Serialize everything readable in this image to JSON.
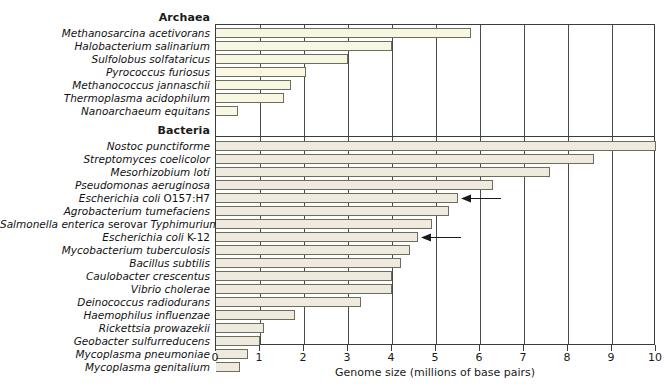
{
  "chart_data": {
    "type": "bar",
    "orientation": "horizontal",
    "title": "",
    "xlabel": "Genome size (millions of base pairs)",
    "ylabel": "",
    "xlim": [
      0,
      10
    ],
    "xticks": [
      "0",
      "1",
      "2",
      "3",
      "4",
      "5",
      "6",
      "7",
      "8",
      "9",
      "10"
    ],
    "grid": true,
    "grid_axis": "x",
    "legend": false,
    "groups": [
      {
        "name": "Archaea",
        "bar_color": "#f7f7e2",
        "categories": [
          "Methanosarcina acetivorans",
          "Halobacterium salinarium",
          "Sulfolobus solfataricus",
          "Pyrococcus furiosus",
          "Methanococcus jannaschii",
          "Thermoplasma acidophilum",
          "Nanoarchaeum equitans"
        ],
        "values": [
          5.8,
          4.0,
          3.0,
          2.05,
          1.7,
          1.55,
          0.5
        ]
      },
      {
        "name": "Bacteria",
        "bar_color": "#efeade",
        "categories": [
          "Nostoc punctiforme",
          "Streptomyces coelicolor",
          "Mesorhizobium loti",
          "Pseudomonas aeruginosa",
          "Escherichia coli O157:H7",
          "Agrobacterium tumefaciens",
          "Salmonella enterica serovar Typhimurium",
          "Escherichia coli K-12",
          "Mycobacterium tuberculosis",
          "Bacillus subtilis",
          "Caulobacter crescentus",
          "Vibrio cholerae",
          "Deinococcus radiodurans",
          "Haemophilus influenzae",
          "Rickettsia prowazekii",
          "Geobacter sulfurreducens",
          "Mycoplasma pneumoniae",
          "Mycoplasma genitalium"
        ],
        "values": [
          10.0,
          8.6,
          7.6,
          6.3,
          5.5,
          5.3,
          4.9,
          4.6,
          4.4,
          4.2,
          4.0,
          4.0,
          3.3,
          1.8,
          1.1,
          1.0,
          0.73,
          0.55
        ]
      }
    ],
    "annotations": [
      {
        "label": "arrow-pointer",
        "target_category": "Escherichia coli O157:H7",
        "target_value": 5.5
      },
      {
        "label": "arrow-pointer",
        "target_category": "Escherichia coli K-12",
        "target_value": 4.6
      }
    ]
  },
  "axis_title_color": "#1a1a1a",
  "frame_color": "#3b3b3b"
}
